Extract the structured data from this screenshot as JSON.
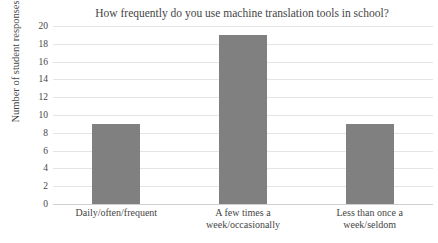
{
  "chart_data": {
    "type": "bar",
    "title": "How frequently do you use machine translation tools in school?",
    "xlabel": "",
    "ylabel": "Number of student responses",
    "categories": [
      "Daily/often/frequent",
      "A few times a\nweek/occasionally",
      "Less than once a\nweek/seldom"
    ],
    "category_lines": [
      [
        "Daily/often/frequent"
      ],
      [
        "A few times a",
        "week/occasionally"
      ],
      [
        "Less than once a",
        "week/seldom"
      ]
    ],
    "values": [
      9,
      19,
      9
    ],
    "ylim": [
      0,
      20
    ],
    "yticks": [
      0,
      2,
      4,
      6,
      8,
      10,
      12,
      14,
      16,
      18,
      20
    ],
    "ytick_labels": [
      "0",
      "2",
      "4",
      "6",
      "8",
      "10",
      "12",
      "14",
      "16",
      "18",
      "20"
    ],
    "grid": true,
    "legend": false,
    "bar_color": "#808080",
    "gridline_color": "#e4e4e4",
    "text_color": "#454545",
    "background_color": "#ffffff"
  }
}
